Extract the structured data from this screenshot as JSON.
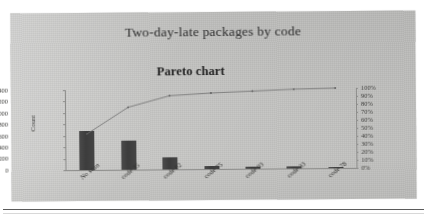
{
  "figure": {
    "main_title": "Two-day-late packages by code",
    "sub_title": "Pareto chart"
  },
  "chart_data": {
    "type": "bar",
    "title": "Pareto chart",
    "subtitle": "Two-day-late packages by code",
    "xlabel": "",
    "ylabel": "Count",
    "y2label": "",
    "categories": [
      "No scan",
      "code 35",
      "code 02",
      "code 75",
      "code 03",
      "code 33",
      "code 78"
    ],
    "values": [
      680,
      500,
      205,
      45,
      35,
      30,
      25
    ],
    "series": [
      {
        "name": "Count",
        "type": "bar",
        "axis": "left",
        "values": [
          680,
          500,
          205,
          45,
          35,
          30,
          25
        ]
      },
      {
        "name": "Cumulative %",
        "type": "line",
        "axis": "right",
        "values": [
          45,
          78,
          92,
          95,
          97,
          99,
          100
        ]
      }
    ],
    "ylim": [
      0,
      1400
    ],
    "y2lim": [
      0,
      100
    ],
    "yticks": [
      0,
      200,
      400,
      600,
      800,
      1000,
      1200,
      1400
    ],
    "ytick_labels": [
      "0",
      "200",
      "400",
      "600",
      "800",
      "1000",
      "1200",
      "1400"
    ],
    "y2ticks": [
      0,
      10,
      20,
      30,
      40,
      50,
      60,
      70,
      80,
      90,
      100
    ],
    "y2tick_labels": [
      "0%",
      "10%",
      "20%",
      "30%",
      "40%",
      "50%",
      "60%",
      "70%",
      "80%",
      "90%",
      "100%"
    ],
    "grid": false,
    "legend": "none",
    "bar_color": "#3f3f3f",
    "line_color": "#6e6e6e"
  }
}
